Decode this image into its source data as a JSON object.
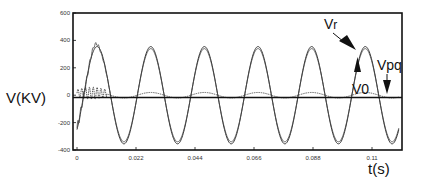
{
  "chart_data": {
    "type": "line",
    "title": "",
    "xlabel": "t(s)",
    "ylabel": "V(KV)",
    "xlim": [
      0,
      0.12
    ],
    "ylim": [
      -400,
      600
    ],
    "xticks": [
      0,
      0.022,
      0.044,
      0.066,
      0.088,
      0.11
    ],
    "xtick_labels": [
      "0",
      "0.022",
      "0.044",
      "0.066",
      "0.088",
      "0.11"
    ],
    "yticks": [
      600,
      400,
      200,
      0,
      -200,
      -400
    ],
    "ytick_labels": [
      "600",
      "400",
      "200",
      "0",
      "-200",
      "-400"
    ],
    "grid": false,
    "legend": null,
    "series": [
      {
        "name": "Vr",
        "description": "50 Hz sinusoid, amplitude ~340 kV (with initial transient up to ~390 kV)",
        "frequency_hz": 50,
        "amplitude_kv": 340,
        "phase_peak_t": 0.0075
      },
      {
        "name": "Vpq",
        "description": "50 Hz sinusoid, amplitude ~355 kV, closely tracking Vr",
        "frequency_hz": 50,
        "amplitude_kv": 355,
        "phase_peak_t": 0.0075
      },
      {
        "name": "V0",
        "description": "near-zero sequence voltage, small ripple ~±25 kV with initial oscillation up to ~60 kV",
        "frequency_hz": 50,
        "amplitude_kv": 20
      }
    ],
    "annotations": [
      {
        "text": "Vr",
        "points_to_t": 0.103,
        "points_to_v": 330
      },
      {
        "text": "V0",
        "points_to_t": 0.103,
        "points_to_v": 20
      },
      {
        "text": "Vpq",
        "points_to_t": 0.117,
        "points_to_v": 10
      }
    ]
  },
  "labels": {
    "ylabel": "V(KV)",
    "xlabel": "t(s)",
    "vr": "Vr",
    "vr_main": "V",
    "vr_sub": "r",
    "v0": "V0",
    "vpq": "Vpq"
  }
}
